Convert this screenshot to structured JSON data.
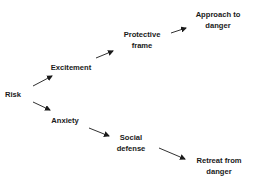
{
  "diagram": {
    "type": "flow",
    "nodes": [
      {
        "id": "risk",
        "lines": [
          "Risk"
        ],
        "x": 13,
        "y": 94
      },
      {
        "id": "excitement",
        "lines": [
          "Excitement"
        ],
        "x": 71,
        "y": 67
      },
      {
        "id": "protective_frame",
        "lines": [
          "Protective",
          "frame"
        ],
        "x": 142,
        "y": 40
      },
      {
        "id": "approach_to_danger",
        "lines": [
          "Approach to",
          "danger"
        ],
        "x": 218,
        "y": 20
      },
      {
        "id": "anxiety",
        "lines": [
          "Anxiety"
        ],
        "x": 65,
        "y": 120
      },
      {
        "id": "social_defense",
        "lines": [
          "Social",
          "defense"
        ],
        "x": 131,
        "y": 143
      },
      {
        "id": "retreat_from_danger",
        "lines": [
          "Retreat from",
          "danger"
        ],
        "x": 219,
        "y": 166
      }
    ],
    "edges": [
      {
        "from": "risk",
        "to": "excitement",
        "x1": 33,
        "y1": 86,
        "x2": 52,
        "y2": 76
      },
      {
        "from": "excitement",
        "to": "protective_frame",
        "x1": 96,
        "y1": 58,
        "x2": 113,
        "y2": 51
      },
      {
        "from": "protective_frame",
        "to": "approach_to_danger",
        "x1": 171,
        "y1": 33,
        "x2": 186,
        "y2": 28
      },
      {
        "from": "risk",
        "to": "anxiety",
        "x1": 33,
        "y1": 102,
        "x2": 50,
        "y2": 110
      },
      {
        "from": "anxiety",
        "to": "social_defense",
        "x1": 89,
        "y1": 128,
        "x2": 109,
        "y2": 136
      },
      {
        "from": "social_defense",
        "to": "retreat_from_danger",
        "x1": 159,
        "y1": 148,
        "x2": 185,
        "y2": 159
      }
    ],
    "colors": {
      "text": "#1a1a1a",
      "arrow": "#1a1a1a",
      "background": "#ffffff"
    }
  }
}
